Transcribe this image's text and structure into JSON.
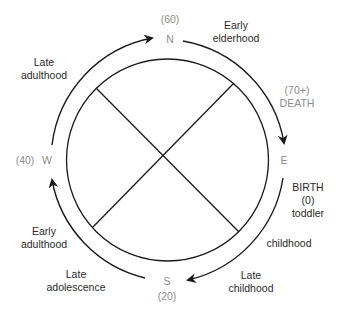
{
  "colors": {
    "stroke": "#1a1a1a",
    "stage_text": "#2a2a2a",
    "compass_text": "#8c8c8c",
    "background": "#ffffff"
  },
  "compass": {
    "north": {
      "letter": "N",
      "age": "(60)"
    },
    "east": {
      "letter": "E",
      "age": "(70+)",
      "event": "DEATH"
    },
    "south": {
      "letter": "S",
      "age": "(20)"
    },
    "west": {
      "letter": "W",
      "age": "(40)"
    }
  },
  "birth": {
    "event": "BIRTH",
    "age": "(0)",
    "stage": "toddler"
  },
  "stages": {
    "early_elderhood": {
      "line1": "Early",
      "line2": "elderhood"
    },
    "late_adulthood": {
      "line1": "Late",
      "line2": "adulthood"
    },
    "early_adulthood": {
      "line1": "Early",
      "line2": "adulthood"
    },
    "late_adolescence": {
      "line1": "Late",
      "line2": "adolescence"
    },
    "childhood": {
      "line1": "childhood"
    },
    "late_childhood": {
      "line1": "Late",
      "line2": "childhood"
    }
  }
}
